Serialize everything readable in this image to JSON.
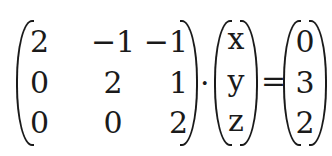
{
  "equation": {
    "description": "Matrix equation A · v = b",
    "matrix_A": {
      "rows": [
        [
          "2",
          "−1",
          "−1"
        ],
        [
          "0",
          "2",
          "1"
        ],
        [
          "0",
          "0",
          "2"
        ]
      ]
    },
    "operator_multiply": "·",
    "vector_v": [
      "x",
      "y",
      "z"
    ],
    "operator_equals": "=",
    "vector_b": [
      "0",
      "3",
      "2"
    ]
  }
}
